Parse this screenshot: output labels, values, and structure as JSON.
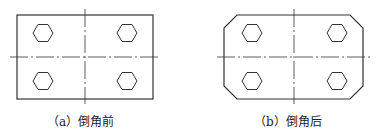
{
  "figures": [
    {
      "id": "a",
      "caption": "（a）倒角前",
      "shape": "rectangle",
      "chamfered": false
    },
    {
      "id": "b",
      "caption": "（b）倒角后",
      "shape": "chamfered-rectangle",
      "chamfered": true
    }
  ],
  "colors": {
    "line": "#333333",
    "background": "#ffffff"
  }
}
